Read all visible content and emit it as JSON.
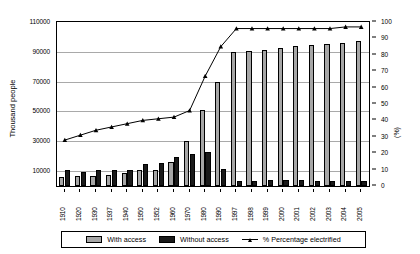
{
  "chart_data": {
    "type": "bar",
    "title": "",
    "subtitle": "",
    "xlabel": "",
    "ylabel": "Thousand people",
    "y2label": "(%)",
    "ylim": [
      0,
      110000
    ],
    "y2lim": [
      0,
      100
    ],
    "grid": true,
    "legend_position": "bottom",
    "categories": [
      "1910",
      "1920",
      "1930",
      "1937",
      "1940",
      "1950",
      "1952",
      "1960",
      "1970",
      "1980",
      "1990",
      "1997",
      "1998",
      "1999",
      "2000",
      "2001",
      "2002",
      "2003",
      "2004",
      "2005"
    ],
    "yticks": [
      "10000",
      "30000",
      "50000",
      "70000",
      "90000",
      "110000"
    ],
    "ytick_values": [
      10000,
      30000,
      50000,
      70000,
      90000,
      110000
    ],
    "y2ticks": [
      "0",
      "10",
      "20",
      "30",
      "40",
      "50",
      "60",
      "70",
      "80",
      "90",
      "100"
    ],
    "y2tick_values": [
      0,
      10,
      20,
      30,
      40,
      50,
      60,
      70,
      80,
      90,
      100
    ],
    "series": [
      {
        "name": "With access",
        "type": "bar",
        "color": "#a6a6a6",
        "axis": "left",
        "values": [
          6000,
          6500,
          7000,
          7500,
          8500,
          10500,
          11000,
          16000,
          30000,
          51000,
          70000,
          90000,
          90500,
          91500,
          92500,
          94000,
          94500,
          95000,
          96000,
          97000
        ]
      },
      {
        "name": "Without access",
        "type": "bar",
        "color": "#1a1a1a",
        "axis": "left",
        "values": [
          10500,
          9500,
          10500,
          10700,
          11000,
          15000,
          15500,
          19500,
          21500,
          22500,
          11500,
          3500,
          3500,
          3700,
          3700,
          3900,
          3600,
          3600,
          3400,
          3300
        ]
      },
      {
        "name": "% Percentage electrified",
        "type": "line",
        "color": "#000000",
        "axis": "right",
        "marker": "triangle",
        "values": [
          28,
          31,
          34,
          36,
          38,
          40,
          41,
          42,
          46,
          67,
          85,
          96,
          96,
          96,
          96,
          96,
          96,
          96,
          97,
          97
        ]
      }
    ]
  },
  "legend": {
    "items": [
      {
        "label": "With access",
        "swatch": "gray-square-swatch"
      },
      {
        "label": "Without access",
        "swatch": "black-square-swatch"
      },
      {
        "label": "% Percentage electrified",
        "swatch": "line-marker-swatch"
      }
    ]
  }
}
